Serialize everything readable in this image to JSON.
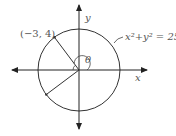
{
  "diagram": {
    "point_label": "(−3, 4)",
    "equation": "x²+y² = 25",
    "angle_label": "θ",
    "x_axis_label": "x",
    "y_axis_label": "y",
    "colors": {
      "stroke": "#333333",
      "text": "#555555"
    }
  }
}
